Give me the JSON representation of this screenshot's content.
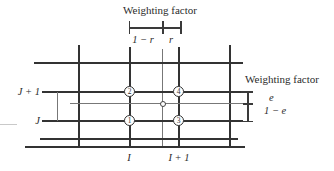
{
  "diagram": {
    "title_top": "Weighting factor",
    "title_right": "Weighting factor",
    "horizontal_weights": {
      "left": "1 − r",
      "right": "r"
    },
    "vertical_weights": {
      "upper": "e",
      "lower": "1 − e"
    },
    "row_labels": {
      "upper": "J + 1",
      "lower": "J"
    },
    "column_labels": {
      "left": "I",
      "right": "I + 1"
    },
    "nodes": {
      "top_left": "2",
      "top_right": "4",
      "bottom_left": "1",
      "bottom_right": "3"
    },
    "colors": {
      "grid_line": "#333333",
      "thin_line": "#777777",
      "text": "#2b2b2b",
      "background": "#ffffff"
    }
  }
}
